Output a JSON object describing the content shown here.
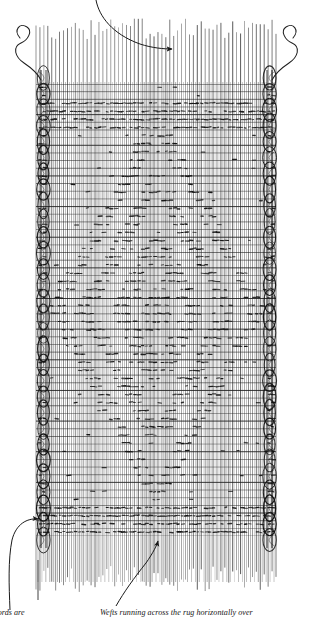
{
  "figure": {
    "type": "technical-illustration",
    "background_color": "#ffffff",
    "ink_color": "#1a1a1a",
    "warp_color": "#2b2b2b",
    "weft_color": "#1f1f1f",
    "knot_color": "#141414",
    "selvedge_color": "#111111",
    "leader_color": "#222222"
  },
  "captions": {
    "left": "cords are",
    "right": "Wefts running across the rug horizontally over"
  },
  "labels": {
    "warp_label": "warp-threads",
    "weft_label": "weft-threads",
    "selvedge_label": "selvedge-cords",
    "knot_label": "pile-knots",
    "loose_yarn_label": "loose-weft-yarn-end"
  },
  "leaders": [
    {
      "name": "warp-leader-arrow",
      "from": [
        96,
        0
      ],
      "to": [
        176,
        50
      ],
      "direction": "right",
      "target": "warp-threads"
    },
    {
      "name": "selvedge-leader-arrow",
      "from": [
        10,
        600
      ],
      "to": [
        44,
        519
      ],
      "direction": "right",
      "target": "selvedge-cords"
    },
    {
      "name": "weft-leader-arrow",
      "from": [
        118,
        600
      ],
      "to": [
        158,
        537
      ],
      "direction": "up",
      "target": "weft-threads"
    }
  ],
  "structure": {
    "warp_count": 62,
    "weft_rows": 60,
    "woven_area": {
      "x": 36,
      "y": 84,
      "width": 240,
      "height": 452
    },
    "warp_top_extent": 18,
    "warp_bottom_extent": 592,
    "selvedge_left_x": 41,
    "selvedge_right_x": 272,
    "selvedge_wrap_count": 30
  },
  "chart_data": {
    "type": "heatmap",
    "xlabel": "warp column",
    "ylabel": "weft row",
    "grid": true,
    "legend": "none",
    "motif": "central diamond medallion with border bands",
    "columns": 60,
    "rows": 56,
    "bands": [
      {
        "name": "top-border-band",
        "row_start": 2,
        "row_end": 5,
        "density": "dense"
      },
      {
        "name": "upper-field",
        "row_start": 6,
        "row_end": 14,
        "density": "sparse"
      },
      {
        "name": "medallion",
        "row_start": 12,
        "row_end": 46,
        "density": "dense"
      },
      {
        "name": "lower-field",
        "row_start": 47,
        "row_end": 51,
        "density": "sparse"
      },
      {
        "name": "bottom-border-band",
        "row_start": 52,
        "row_end": 55,
        "density": "dense"
      }
    ],
    "values": [
      0,
      1
    ]
  }
}
